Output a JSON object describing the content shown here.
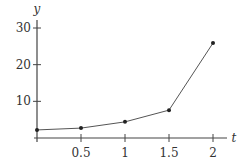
{
  "chart_data": {
    "type": "line",
    "title": "",
    "xlabel": "t",
    "ylabel": "y",
    "x": [
      0,
      0.5,
      1,
      1.5,
      2
    ],
    "series": [
      {
        "name": "y",
        "values": [
          2.2,
          2.7,
          4.4,
          7.6,
          25.9
        ],
        "markers": true
      }
    ],
    "xticks": [
      0.5,
      1,
      1.5,
      2
    ],
    "xtick_labels": [
      "0.5",
      "1",
      "1.5",
      "2"
    ],
    "yticks": [
      10,
      20,
      30
    ],
    "ytick_labels": [
      "10",
      "20",
      "30"
    ],
    "xlim": [
      0,
      2.3
    ],
    "ylim": [
      0,
      32
    ],
    "grid": false,
    "legend": "none",
    "colors": {
      "line": "#555555",
      "axis": "#444444",
      "marker": "#222222"
    }
  }
}
